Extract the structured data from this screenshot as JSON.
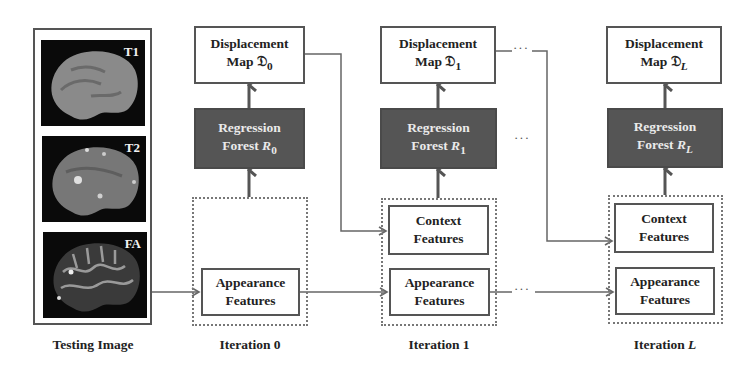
{
  "testing_image": {
    "label": "Testing Image",
    "modalities": [
      {
        "label": "T1"
      },
      {
        "label": "T2"
      },
      {
        "label": "FA"
      }
    ]
  },
  "iterations": [
    {
      "label": "Iteration 0",
      "label_main": "Iteration ",
      "label_index": "0",
      "displacement": {
        "line1": "Displacement",
        "line2": "Map ",
        "symbol": "𝔇",
        "sub": "0"
      },
      "forest": {
        "line1": "Regression",
        "line2": "Forest ",
        "symbol": "R",
        "sub": "0"
      },
      "features": [
        {
          "line1": "Appearance",
          "line2": "Features"
        }
      ]
    },
    {
      "label": "Iteration 1",
      "label_main": "Iteration ",
      "label_index": "1",
      "displacement": {
        "line1": "Displacement",
        "line2": "Map ",
        "symbol": "𝔇",
        "sub": "1"
      },
      "forest": {
        "line1": "Regression",
        "line2": "Forest ",
        "symbol": "R",
        "sub": "1"
      },
      "features": [
        {
          "line1": "Context",
          "line2": "Features"
        },
        {
          "line1": "Appearance",
          "line2": "Features"
        }
      ]
    },
    {
      "label": "Iteration L",
      "label_main": "Iteration ",
      "label_index": "L",
      "displacement": {
        "line1": "Displacement",
        "line2": "Map ",
        "symbol": "𝔇",
        "sub": "L"
      },
      "forest": {
        "line1": "Regression",
        "line2": "Forest ",
        "symbol": "R",
        "sub": "L"
      },
      "features": [
        {
          "line1": "Context",
          "line2": "Features"
        },
        {
          "line1": "Appearance",
          "line2": "Features"
        }
      ]
    }
  ],
  "ellipsis": "···",
  "colors": {
    "forest_fill": "#555555",
    "forest_text": "#eaeaea",
    "line": "#666666",
    "border": "#555555"
  }
}
